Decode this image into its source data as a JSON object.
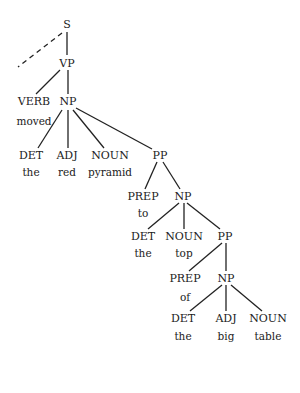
{
  "tree": {
    "nodes": [
      {
        "id": "S",
        "label": "S",
        "x": 67,
        "y": 24
      },
      {
        "id": "VP",
        "label": "VP",
        "x": 67,
        "y": 63
      },
      {
        "id": "VERB",
        "label": "VERB",
        "x": 34,
        "y": 101
      },
      {
        "id": "NP1",
        "label": "NP",
        "x": 68,
        "y": 101
      },
      {
        "id": "DET1",
        "label": "DET",
        "x": 31,
        "y": 155
      },
      {
        "id": "ADJ1",
        "label": "ADJ",
        "x": 67,
        "y": 155
      },
      {
        "id": "NOUN1",
        "label": "NOUN",
        "x": 110,
        "y": 155
      },
      {
        "id": "PP1",
        "label": "PP",
        "x": 160,
        "y": 155
      },
      {
        "id": "PREP1",
        "label": "PREP",
        "x": 143,
        "y": 196
      },
      {
        "id": "NP2",
        "label": "NP",
        "x": 183,
        "y": 196
      },
      {
        "id": "DET2",
        "label": "DET",
        "x": 143,
        "y": 236
      },
      {
        "id": "NOUN2",
        "label": "NOUN",
        "x": 184,
        "y": 236
      },
      {
        "id": "PP2",
        "label": "PP",
        "x": 225,
        "y": 236
      },
      {
        "id": "PREP2",
        "label": "PREP",
        "x": 185,
        "y": 278
      },
      {
        "id": "NP3",
        "label": "NP",
        "x": 226,
        "y": 278
      },
      {
        "id": "DET3",
        "label": "DET",
        "x": 183,
        "y": 318
      },
      {
        "id": "ADJ2",
        "label": "ADJ",
        "x": 226,
        "y": 318
      },
      {
        "id": "NOUN3",
        "label": "NOUN",
        "x": 268,
        "y": 318
      }
    ],
    "words": [
      {
        "label": "moved",
        "x": 34,
        "y": 121
      },
      {
        "label": "the",
        "x": 31,
        "y": 172
      },
      {
        "label": "red",
        "x": 67,
        "y": 172
      },
      {
        "label": "pyramid",
        "x": 110,
        "y": 172
      },
      {
        "label": "to",
        "x": 143,
        "y": 213
      },
      {
        "label": "the",
        "x": 143,
        "y": 253
      },
      {
        "label": "top",
        "x": 184,
        "y": 253
      },
      {
        "label": "of",
        "x": 185,
        "y": 297
      },
      {
        "label": "the",
        "x": 183,
        "y": 336
      },
      {
        "label": "big",
        "x": 226,
        "y": 336
      },
      {
        "label": "table",
        "x": 268,
        "y": 336
      }
    ],
    "edges": [
      {
        "x1": 67,
        "y1": 32,
        "x2": 67,
        "y2": 55,
        "dashed": false
      },
      {
        "x1": 62,
        "y1": 33,
        "x2": 18,
        "y2": 67,
        "dashed": true
      },
      {
        "x1": 60,
        "y1": 70,
        "x2": 36,
        "y2": 94,
        "dashed": false
      },
      {
        "x1": 68,
        "y1": 70,
        "x2": 68,
        "y2": 94,
        "dashed": false
      },
      {
        "x1": 62,
        "y1": 110,
        "x2": 38,
        "y2": 148,
        "dashed": false
      },
      {
        "x1": 68,
        "y1": 110,
        "x2": 68,
        "y2": 148,
        "dashed": false
      },
      {
        "x1": 73,
        "y1": 110,
        "x2": 104,
        "y2": 148,
        "dashed": false
      },
      {
        "x1": 76,
        "y1": 108,
        "x2": 152,
        "y2": 149,
        "dashed": false
      },
      {
        "x1": 157,
        "y1": 162,
        "x2": 145,
        "y2": 189,
        "dashed": false
      },
      {
        "x1": 163,
        "y1": 162,
        "x2": 180,
        "y2": 189,
        "dashed": false
      },
      {
        "x1": 179,
        "y1": 203,
        "x2": 148,
        "y2": 229,
        "dashed": false
      },
      {
        "x1": 184,
        "y1": 203,
        "x2": 184,
        "y2": 229,
        "dashed": false
      },
      {
        "x1": 187,
        "y1": 203,
        "x2": 220,
        "y2": 229,
        "dashed": false
      },
      {
        "x1": 222,
        "y1": 243,
        "x2": 189,
        "y2": 271,
        "dashed": false
      },
      {
        "x1": 226,
        "y1": 243,
        "x2": 226,
        "y2": 271,
        "dashed": false
      },
      {
        "x1": 222,
        "y1": 285,
        "x2": 190,
        "y2": 311,
        "dashed": false
      },
      {
        "x1": 226,
        "y1": 285,
        "x2": 226,
        "y2": 311,
        "dashed": false
      },
      {
        "x1": 231,
        "y1": 285,
        "x2": 262,
        "y2": 311,
        "dashed": false
      }
    ]
  }
}
